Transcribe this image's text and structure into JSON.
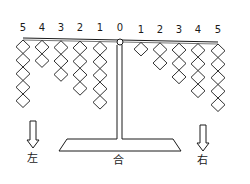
{
  "diagram": {
    "type": "balance-scale",
    "beam_tilt": "right side lower",
    "center_label": "0",
    "left_arm": {
      "positions": [
        {
          "label": "5",
          "weights": 5
        },
        {
          "label": "4",
          "weights": 2
        },
        {
          "label": "3",
          "weights": 3
        },
        {
          "label": "2",
          "weights": 4
        },
        {
          "label": "1",
          "weights": 5
        }
      ]
    },
    "right_arm": {
      "positions": [
        {
          "label": "1",
          "weights": 1
        },
        {
          "label": "2",
          "weights": 2
        },
        {
          "label": "3",
          "weights": 3
        },
        {
          "label": "4",
          "weights": 4
        },
        {
          "label": "5",
          "weights": 5
        }
      ]
    },
    "labels": {
      "left": "左",
      "center": "合",
      "right": "右"
    },
    "colors": {
      "ink": "#1a1a1a",
      "background": "#ffffff"
    }
  }
}
